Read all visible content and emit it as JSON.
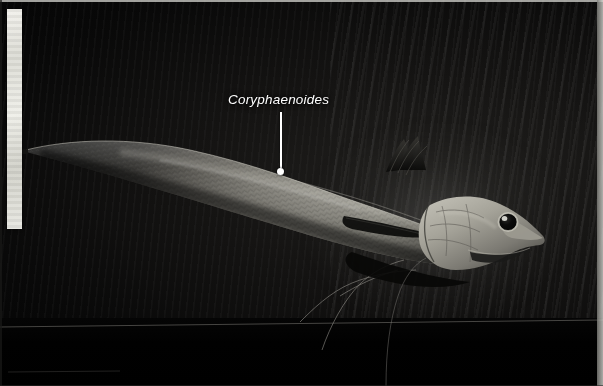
{
  "image": {
    "kind": "underwater-photograph",
    "subject": "deep-sea grenadier fish",
    "width": 603,
    "height": 386,
    "background_color": "#000000",
    "scene_description": "Dark deep-sea photograph of an elongate rattail fish lit from above, tapering tail at left, large head and eye at right"
  },
  "annotation": {
    "label_text": "Coryphaenoides",
    "label_style": "italic",
    "label_color": "#ffffff",
    "leader_line_color": "#ffffff",
    "leader_dot_color": "#ffffff",
    "leader_target_x": 281,
    "leader_target_y": 172
  },
  "scale_bar": {
    "name": "vertical-white-reference-bar",
    "color": "#efefe9",
    "x": 7,
    "y": 9,
    "width": 15,
    "height": 220
  },
  "film_border": {
    "top_edge_color": "#c9c9c4",
    "right_edge_color": "#d6d6d1"
  },
  "fish_features": {
    "body_color_light": "#b8b6ae",
    "body_color_mid": "#6e6c66",
    "body_color_dark": "#1c1b19",
    "eye_color": "#0a0a0a",
    "eye_highlight_color": "#e6e6e0",
    "parts": [
      "tapering-tail",
      "scaled-body",
      "dorsal-fin",
      "pectoral-fin",
      "pelvic-fin-filaments",
      "head",
      "eye",
      "snout",
      "mouth"
    ]
  }
}
